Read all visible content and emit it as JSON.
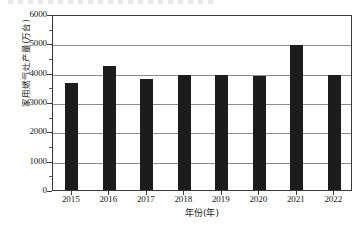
{
  "chart_data": {
    "type": "bar",
    "title": "",
    "subtitle": "",
    "xlabel": "年份(年)",
    "ylabel": "家用燃气灶产量(万台)",
    "categories": [
      "2015",
      "2016",
      "2017",
      "2018",
      "2019",
      "2020",
      "2021",
      "2022"
    ],
    "values": [
      3650,
      4220,
      3800,
      3920,
      3920,
      3880,
      4950,
      3910
    ],
    "series": [
      {
        "name": "家用燃气灶产量",
        "values": [
          3650,
          4220,
          3800,
          3920,
          3920,
          3880,
          4950,
          3910
        ]
      }
    ],
    "ylim": [
      0,
      6000
    ],
    "ytick_labels": [
      "0",
      "1000",
      "2000",
      "3000",
      "4000",
      "5000",
      "6000"
    ],
    "ytick_values": [
      0,
      1000,
      2000,
      3000,
      4000,
      5000,
      6000
    ],
    "yminor_values": [
      500,
      1500,
      2500,
      3500,
      4500,
      5500
    ],
    "grid": "horizontal",
    "legend": "none",
    "bar_color": "#1c1c1c",
    "frame_color": "#3a3a3a",
    "grid_color": "#8d8d8d",
    "background_color": "#ffffff"
  }
}
